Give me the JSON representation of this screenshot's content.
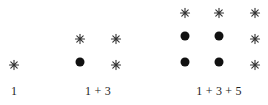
{
  "diagram": {
    "colors": {
      "dot": "#111111",
      "star": "#333333",
      "text": "#222222"
    },
    "groups": [
      {
        "label": "1",
        "label_pos": [
          14,
          91
        ],
        "marks": [
          {
            "type": "star",
            "x": 14,
            "y": 62
          }
        ]
      },
      {
        "label": "1 + 3",
        "label_pos": [
          98,
          91
        ],
        "marks": [
          {
            "type": "star",
            "x": 80,
            "y": 36
          },
          {
            "type": "star",
            "x": 116,
            "y": 36
          },
          {
            "type": "dot",
            "x": 80,
            "y": 62
          },
          {
            "type": "star",
            "x": 116,
            "y": 62
          }
        ]
      },
      {
        "label": "1 + 3 + 5",
        "label_pos": [
          219,
          91
        ],
        "marks": [
          {
            "type": "star",
            "x": 185,
            "y": 10
          },
          {
            "type": "star",
            "x": 219,
            "y": 10
          },
          {
            "type": "star",
            "x": 255,
            "y": 10
          },
          {
            "type": "dot",
            "x": 185,
            "y": 36
          },
          {
            "type": "dot",
            "x": 219,
            "y": 36
          },
          {
            "type": "star",
            "x": 255,
            "y": 36
          },
          {
            "type": "dot",
            "x": 185,
            "y": 62
          },
          {
            "type": "dot",
            "x": 219,
            "y": 62
          },
          {
            "type": "star",
            "x": 255,
            "y": 62
          }
        ]
      }
    ]
  }
}
